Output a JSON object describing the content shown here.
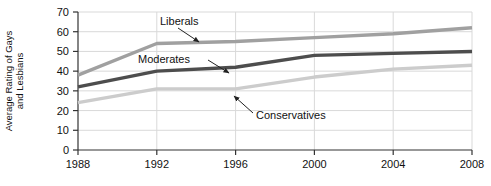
{
  "chart_data": {
    "type": "line",
    "title": "",
    "xlabel": "",
    "ylabel": "Average Rating of Gays and Lesbians",
    "ylabel_line1": "Average Rating of Gays",
    "ylabel_line2": "and Lesbians",
    "x": [
      1988,
      1992,
      1996,
      2000,
      2004,
      2008
    ],
    "categories": [
      "1988",
      "1992",
      "1996",
      "2000",
      "2004",
      "2008"
    ],
    "xlim": [
      1988,
      2008
    ],
    "ylim": [
      0,
      70
    ],
    "yticks": [
      0,
      10,
      20,
      30,
      40,
      50,
      60,
      70
    ],
    "ytick_labels": [
      "0",
      "10",
      "20",
      "30",
      "40",
      "50",
      "60",
      "70"
    ],
    "xticks": [
      1988,
      1992,
      1996,
      2000,
      2004,
      2008
    ],
    "xtick_labels": [
      "1988",
      "1992",
      "1996",
      "2000",
      "2004",
      "2008"
    ],
    "grid": true,
    "grid_color": "#d9d9d9",
    "legend": "annotations",
    "legend_position": "inline-annotations",
    "series": [
      {
        "name": "Liberals",
        "color": "#a0a0a0",
        "values": [
          38,
          54,
          55,
          57,
          59,
          62
        ]
      },
      {
        "name": "Moderates",
        "color": "#4d4d4d",
        "values": [
          32,
          40,
          42,
          48,
          49,
          50
        ]
      },
      {
        "name": "Conservatives",
        "color": "#cccccc",
        "values": [
          24,
          31,
          31,
          37,
          41,
          43
        ]
      }
    ],
    "annotations": [
      {
        "text": "Liberals",
        "series": "Liberals",
        "label_x": 160,
        "label_y": 22
      },
      {
        "text": "Moderates",
        "series": "Moderates",
        "label_x": 138,
        "label_y": 60
      },
      {
        "text": "Conservatives",
        "series": "Conservatives",
        "label_x": 243,
        "label_y": 116
      }
    ]
  },
  "axis": {
    "y_title_line1": "Average Rating of Gays",
    "y_title_line2": "and Lesbians"
  }
}
